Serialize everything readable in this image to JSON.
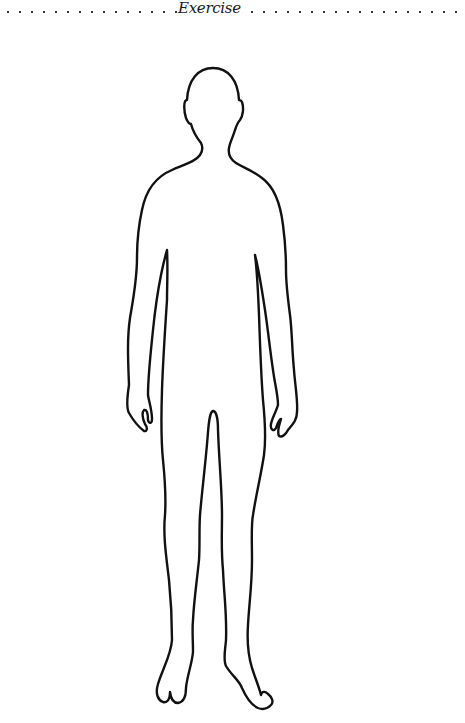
{
  "header": {
    "title": "Exercise"
  },
  "figure": {
    "stroke_color": "#111111",
    "fill_color": "#ffffff"
  }
}
